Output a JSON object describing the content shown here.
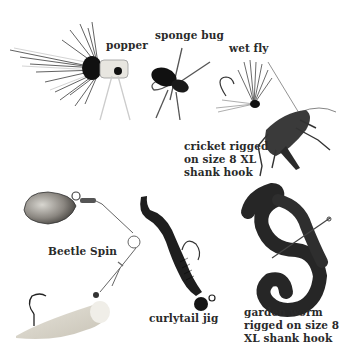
{
  "figure": {
    "labels": {
      "popper": "popper",
      "sponge_bug": "sponge bug",
      "wet_fly": "wet fly",
      "cricket": "cricket rigged\non size 8 XL\nshank hook",
      "beetle_spin": "Beetle Spin",
      "curlytail_jig": "curlytail jig",
      "garden_worm": "garden worm\nrigged on size 8\nXL shank hook"
    },
    "items": [
      {
        "id": "popper",
        "type": "fly"
      },
      {
        "id": "sponge_bug",
        "type": "fly"
      },
      {
        "id": "wet_fly",
        "type": "fly"
      },
      {
        "id": "cricket",
        "type": "live-bait"
      },
      {
        "id": "beetle_spin",
        "type": "spinner-lure"
      },
      {
        "id": "curlytail_jig",
        "type": "soft-plastic-jig"
      },
      {
        "id": "garden_worm",
        "type": "live-bait"
      }
    ],
    "colors": {
      "background": "#ffffff",
      "label_text": "#2a2a2a",
      "dark_body": "#1e1e1e",
      "worm": "#2b2b2b",
      "grub": "#d8d4c8",
      "spinner_blade": "#8a8680"
    }
  }
}
